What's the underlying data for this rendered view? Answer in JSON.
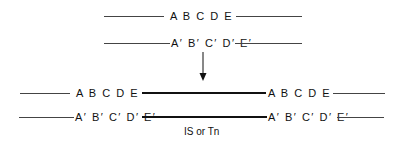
{
  "diagram": {
    "top": {
      "strand1": "A B C D E",
      "strand2": "A′ B′ C′ D′ E′"
    },
    "bottom": {
      "left_strand1": "A B C D E",
      "left_strand2": "A′ B′ C′ D′ E′",
      "right_strand1": "A B C D E",
      "right_strand2": "A′ B′ C′ D′ E′",
      "insert_label": "IS or Tn"
    }
  }
}
